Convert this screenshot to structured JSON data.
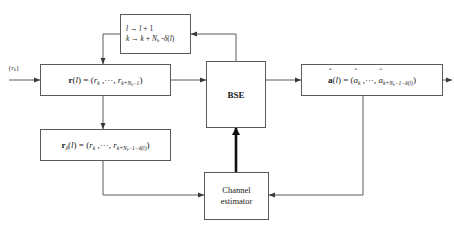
{
  "diagram": {
    "input_label": "{r_k}",
    "blocks": {
      "counter_update": {
        "name": "index-update-block",
        "line1": "l → l + 1",
        "line2": "k → k + N_b - δ(l)"
      },
      "received_vector": {
        "name": "received-vector-block",
        "text": "r(l) = (r_k, ···, r_{k+N_b-1})"
      },
      "delayed_vector": {
        "name": "delayed-received-vector-block",
        "text": "r_δ(l) = (r_k, ···, r_{k+N_b-1-δ(l)})"
      },
      "bse": {
        "name": "bse-block",
        "label": "BSE"
      },
      "estimate_vector": {
        "name": "symbol-estimate-block",
        "text": "â(l) = (â_k, ···, â_{k+N_b-1-δ(l)})"
      },
      "channel_estimator": {
        "name": "channel-estimator-block",
        "line1": "Channel",
        "line2": "estimator"
      }
    },
    "colors": {
      "line": "#5a5a5a",
      "bold_line": "#101010",
      "text": "#1a1a1a",
      "background": "#ffffff"
    }
  }
}
